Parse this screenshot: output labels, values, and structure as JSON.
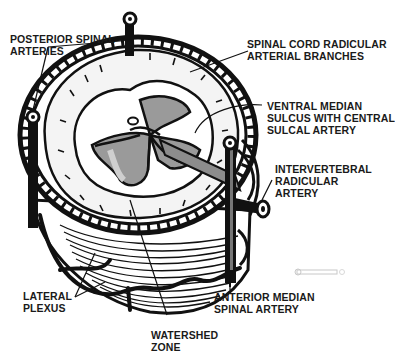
{
  "diagram": {
    "colors": {
      "ink": "#111111",
      "gray_matter": "#9a9a9a",
      "white_matter": "#f4f4f4",
      "background": "#ffffff"
    },
    "labels": [
      {
        "id": "posterior-spinal-arteries",
        "lines": [
          "POSTERIOR SPINAL",
          "ARTERIES"
        ]
      },
      {
        "id": "spinal-cord-radicular-arterial-branches",
        "lines": [
          "SPINAL CORD RADICULAR",
          "ARTERIAL BRANCHES"
        ]
      },
      {
        "id": "ventral-median-sulcus",
        "lines": [
          "VENTRAL MEDIAN",
          "SULCUS WITH CENTRAL",
          "SULCAL ARTERY"
        ]
      },
      {
        "id": "intervertebral-radicular-artery",
        "lines": [
          "INTERVERTEBRAL",
          "RADICULAR",
          "ARTERY"
        ]
      },
      {
        "id": "lateral-plexus",
        "lines": [
          "LATERAL",
          "PLEXUS"
        ]
      },
      {
        "id": "anterior-median-spinal-artery",
        "lines": [
          "ANTERIOR MEDIAN",
          "SPINAL ARTERY"
        ]
      },
      {
        "id": "watershed-zone",
        "lines": [
          "WATERSHED",
          "ZONE"
        ]
      }
    ]
  }
}
